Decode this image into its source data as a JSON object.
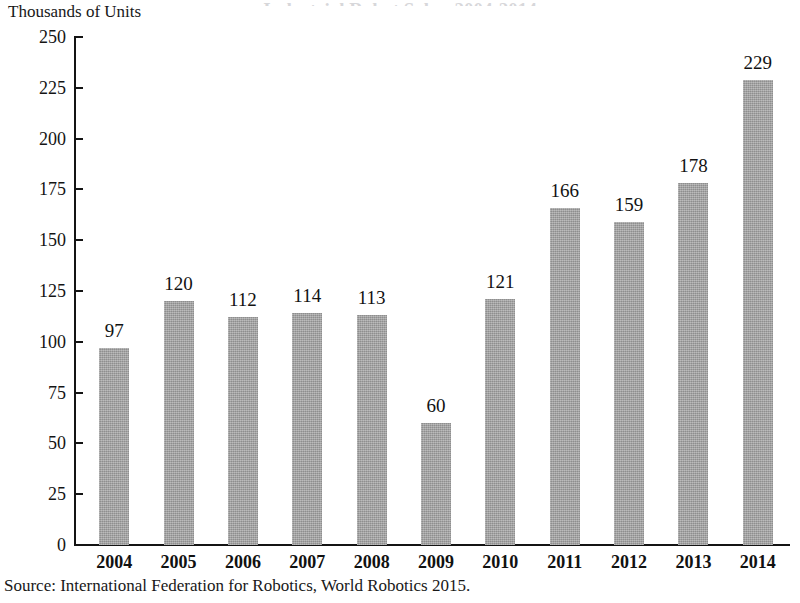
{
  "figure": {
    "clipped_title_remnant": "Industrial Robot Sales, 2004-2014",
    "axis_unit_label": "Thousands of Units",
    "source_note": "Source: International Federation for Robotics, World Robotics 2015.",
    "bar_color": "#a3a3a3",
    "axis_color": "#141414",
    "background_color": "#ffffff"
  },
  "chart_data": {
    "type": "bar",
    "title": "Industrial Robot Sales, 2004-2014",
    "xlabel": "",
    "ylabel": "Thousands of Units",
    "categories": [
      "2004",
      "2005",
      "2006",
      "2007",
      "2008",
      "2009",
      "2010",
      "2011",
      "2012",
      "2013",
      "2014"
    ],
    "values": [
      97,
      120,
      112,
      114,
      113,
      60,
      121,
      166,
      159,
      178,
      229
    ],
    "data_labels": [
      "97",
      "120",
      "112",
      "114",
      "113",
      "60",
      "121",
      "166",
      "159",
      "178",
      "229"
    ],
    "ylim": [
      0,
      250
    ],
    "ytick_values": [
      250,
      225,
      200,
      175,
      150,
      125,
      100,
      75,
      50,
      25,
      0
    ],
    "ytick_labels": [
      "250",
      "225",
      "200",
      "175",
      "150",
      "125",
      "100",
      "75",
      "50",
      "25",
      "0"
    ],
    "ytick_step": 25,
    "grid": false,
    "legend": false,
    "legend_position": "none",
    "series_name": "Industrial robot sales"
  }
}
